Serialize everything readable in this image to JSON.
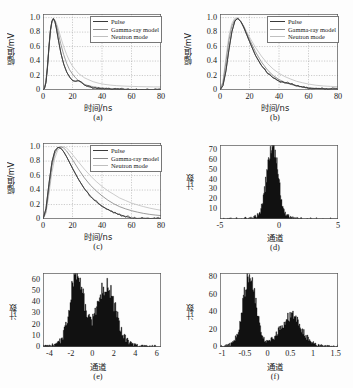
{
  "figure": {
    "panels": [
      "(a)",
      "(b)",
      "(c)",
      "(d)",
      "(e)",
      "(f)"
    ]
  },
  "labels": {
    "y_amplitude": "幅值/mV",
    "x_time": "时间/ns",
    "y_counts": "计数",
    "x_channel": "通道"
  },
  "legend": {
    "items": [
      {
        "label": "Pulse",
        "color": "#3a3a3a"
      },
      {
        "label": "Gamma-ray model",
        "color": "#8a8a8a"
      },
      {
        "label": "Neutron mode",
        "color": "#b8b8b8"
      }
    ]
  },
  "chart_data": [
    {
      "type": "line",
      "panel": "(a)",
      "title": "",
      "xlabel": "时间/ns",
      "ylabel": "幅值/mV",
      "xlim": [
        0,
        80
      ],
      "ylim": [
        0,
        1.05
      ],
      "xticks": [
        0,
        20,
        40,
        60,
        80
      ],
      "yticks": [
        0,
        0.2,
        0.4,
        0.6,
        0.8,
        1.0
      ],
      "ytick_labels": [
        "0",
        "0.2",
        "0.4",
        "0.6",
        "0.8",
        "1.0"
      ],
      "grid": true,
      "legend_position": "upper-right",
      "series": [
        {
          "name": "Pulse",
          "x": [
            0,
            1,
            2,
            3,
            4,
            5,
            6,
            7,
            8,
            9,
            10,
            12,
            14,
            16,
            18,
            20,
            22,
            24,
            26,
            28,
            30,
            34,
            38,
            42,
            46,
            50,
            55,
            60,
            65,
            70,
            75,
            80
          ],
          "values": [
            0,
            0.02,
            0.1,
            0.3,
            0.58,
            0.82,
            0.95,
            0.99,
            0.95,
            0.86,
            0.74,
            0.52,
            0.36,
            0.25,
            0.18,
            0.13,
            0.12,
            0.13,
            0.11,
            0.07,
            0.05,
            0.03,
            0.02,
            0.015,
            0.012,
            0.01,
            0.008,
            0.006,
            0.005,
            0.004,
            0.003,
            0.003
          ]
        },
        {
          "name": "Gamma-ray model",
          "x": [
            0,
            1,
            2,
            3,
            4,
            5,
            6,
            7,
            8,
            9,
            10,
            12,
            14,
            16,
            18,
            20,
            22,
            24,
            26,
            28,
            30,
            34,
            38,
            42,
            46,
            50,
            55,
            60,
            65,
            70,
            75,
            80
          ],
          "values": [
            0,
            0.03,
            0.13,
            0.34,
            0.6,
            0.82,
            0.94,
            0.98,
            0.96,
            0.9,
            0.82,
            0.64,
            0.49,
            0.37,
            0.28,
            0.22,
            0.17,
            0.13,
            0.1,
            0.08,
            0.065,
            0.045,
            0.032,
            0.024,
            0.018,
            0.014,
            0.011,
            0.009,
            0.007,
            0.006,
            0.005,
            0.004
          ]
        },
        {
          "name": "Neutron mode",
          "x": [
            0,
            1,
            2,
            3,
            4,
            5,
            6,
            7,
            8,
            9,
            10,
            12,
            14,
            16,
            18,
            20,
            22,
            24,
            26,
            28,
            30,
            34,
            38,
            42,
            46,
            50,
            55,
            60,
            65,
            70,
            75,
            80
          ],
          "values": [
            0,
            0.03,
            0.12,
            0.32,
            0.57,
            0.79,
            0.92,
            0.97,
            0.97,
            0.93,
            0.87,
            0.73,
            0.6,
            0.49,
            0.4,
            0.33,
            0.28,
            0.23,
            0.2,
            0.17,
            0.15,
            0.115,
            0.092,
            0.077,
            0.067,
            0.06,
            0.054,
            0.05,
            0.047,
            0.045,
            0.043,
            0.042
          ]
        }
      ]
    },
    {
      "type": "line",
      "panel": "(b)",
      "xlabel": "时间/ns",
      "ylabel": "幅值/mV",
      "xlim": [
        0,
        80
      ],
      "ylim": [
        0,
        1.05
      ],
      "xticks": [
        0,
        20,
        40,
        60,
        80
      ],
      "yticks": [
        0,
        0.2,
        0.4,
        0.6,
        0.8,
        1.0
      ],
      "ytick_labels": [
        "0",
        "0.2",
        "0.4",
        "0.6",
        "0.8",
        "1.0"
      ],
      "grid": true,
      "legend_position": "upper-right",
      "series": [
        {
          "name": "Pulse",
          "x": [
            0,
            2,
            4,
            6,
            8,
            10,
            12,
            14,
            16,
            18,
            20,
            24,
            28,
            32,
            36,
            40,
            44,
            48,
            52,
            56,
            60,
            65,
            70,
            75,
            80
          ],
          "values": [
            0,
            0.06,
            0.26,
            0.55,
            0.8,
            0.95,
            0.99,
            0.95,
            0.87,
            0.77,
            0.67,
            0.48,
            0.34,
            0.24,
            0.17,
            0.12,
            0.1,
            0.085,
            0.06,
            0.04,
            0.025,
            0.02,
            0.018,
            0.015,
            0.014
          ]
        },
        {
          "name": "Gamma-ray model",
          "x": [
            0,
            2,
            4,
            6,
            8,
            10,
            12,
            14,
            16,
            18,
            20,
            24,
            28,
            32,
            36,
            40,
            44,
            48,
            52,
            56,
            60,
            65,
            70,
            75,
            80
          ],
          "values": [
            0,
            0.1,
            0.38,
            0.68,
            0.88,
            0.97,
            0.99,
            0.95,
            0.88,
            0.79,
            0.7,
            0.53,
            0.39,
            0.28,
            0.2,
            0.145,
            0.105,
            0.077,
            0.056,
            0.042,
            0.031,
            0.022,
            0.017,
            0.013,
            0.011
          ]
        },
        {
          "name": "Neutron mode",
          "x": [
            0,
            2,
            4,
            6,
            8,
            10,
            12,
            14,
            16,
            18,
            20,
            24,
            28,
            32,
            36,
            40,
            44,
            48,
            52,
            56,
            60,
            65,
            70,
            75,
            80
          ],
          "values": [
            0,
            0.12,
            0.44,
            0.74,
            0.92,
            0.99,
            0.99,
            0.95,
            0.89,
            0.81,
            0.73,
            0.59,
            0.47,
            0.37,
            0.29,
            0.23,
            0.185,
            0.15,
            0.12,
            0.1,
            0.082,
            0.066,
            0.056,
            0.05,
            0.046
          ]
        }
      ]
    },
    {
      "type": "line",
      "panel": "(c)",
      "xlabel": "时间/ns",
      "ylabel": "幅值/mV",
      "xlim": [
        0,
        80
      ],
      "ylim": [
        0,
        1.05
      ],
      "xticks": [
        0,
        20,
        40,
        60,
        80
      ],
      "yticks": [
        0,
        0.2,
        0.4,
        0.6,
        0.8,
        1.0
      ],
      "ytick_labels": [
        "0",
        "0.2",
        "0.4",
        "0.6",
        "0.8",
        "1.0"
      ],
      "grid": true,
      "legend_position": "upper-right",
      "series": [
        {
          "name": "Pulse",
          "x": [
            0,
            2,
            4,
            6,
            8,
            10,
            12,
            14,
            16,
            18,
            20,
            24,
            28,
            32,
            36,
            40,
            44,
            48,
            52,
            56,
            60,
            64,
            68,
            72,
            76,
            80
          ],
          "values": [
            0,
            0.14,
            0.48,
            0.78,
            0.94,
            0.99,
            0.98,
            0.93,
            0.86,
            0.78,
            0.7,
            0.55,
            0.42,
            0.32,
            0.24,
            0.18,
            0.13,
            0.09,
            0.06,
            0.035,
            0.015,
            0.008,
            0.012,
            0.006,
            0.01,
            0.005
          ]
        },
        {
          "name": "Gamma-ray model",
          "x": [
            0,
            2,
            4,
            6,
            8,
            10,
            12,
            14,
            16,
            18,
            20,
            24,
            28,
            32,
            36,
            40,
            44,
            48,
            52,
            56,
            60,
            64,
            68,
            72,
            76,
            80
          ],
          "values": [
            0,
            0.1,
            0.4,
            0.72,
            0.9,
            0.98,
            1.0,
            0.98,
            0.94,
            0.88,
            0.82,
            0.69,
            0.57,
            0.47,
            0.39,
            0.32,
            0.26,
            0.21,
            0.17,
            0.14,
            0.115,
            0.095,
            0.078,
            0.065,
            0.055,
            0.047
          ]
        },
        {
          "name": "Neutron mode",
          "x": [
            0,
            2,
            4,
            6,
            8,
            10,
            12,
            14,
            16,
            18,
            20,
            24,
            28,
            32,
            36,
            40,
            44,
            48,
            52,
            56,
            60,
            64,
            68,
            72,
            76,
            80
          ],
          "values": [
            0,
            0.08,
            0.34,
            0.64,
            0.84,
            0.95,
            0.99,
            1.0,
            0.98,
            0.94,
            0.89,
            0.79,
            0.69,
            0.6,
            0.52,
            0.45,
            0.39,
            0.34,
            0.29,
            0.255,
            0.22,
            0.195,
            0.172,
            0.152,
            0.135,
            0.12
          ]
        }
      ]
    },
    {
      "type": "bar",
      "panel": "(d)",
      "xlabel": "通道",
      "ylabel": "计数",
      "xlim": [
        -5,
        5
      ],
      "ylim": [
        0,
        75
      ],
      "xticks": [
        -5,
        0,
        5
      ],
      "yticks": [
        10,
        20,
        30,
        40,
        50,
        60,
        70
      ],
      "grid": false,
      "distribution": "unimodal",
      "peaks": [
        {
          "center": -0.55,
          "height": 72,
          "width": 0.45
        }
      ],
      "bin_width": 0.05,
      "baseline_noise": 1.5,
      "fill_color": "#111111"
    },
    {
      "type": "bar",
      "panel": "(e)",
      "xlabel": "通道",
      "ylabel": "计数",
      "xlim": [
        -4.6,
        6.4
      ],
      "ylim": [
        0,
        66
      ],
      "xticks": [
        -4,
        -2,
        0,
        2,
        4,
        6
      ],
      "yticks": [
        0,
        10,
        20,
        30,
        40,
        50,
        60
      ],
      "grid": false,
      "distribution": "bimodal",
      "peaks": [
        {
          "center": -1.45,
          "height": 60,
          "width": 0.62
        },
        {
          "center": 1.3,
          "height": 50,
          "width": 0.85
        }
      ],
      "bin_width": 0.07,
      "baseline_noise": 2.0,
      "fill_color": "#111111"
    },
    {
      "type": "bar",
      "panel": "(f)",
      "xlabel": "通道",
      "ylabel": "计数",
      "xlim": [
        -1.05,
        1.55
      ],
      "ylim": [
        0,
        85
      ],
      "xticks": [
        -1,
        -0.5,
        0,
        0.5,
        1,
        1.5
      ],
      "xtick_labels": [
        "-1",
        "-0.5",
        "0",
        "0.5",
        "1",
        "1.5"
      ],
      "yticks": [
        0,
        20,
        40,
        60,
        80
      ],
      "grid": false,
      "distribution": "bimodal",
      "peaks": [
        {
          "center": -0.4,
          "height": 78,
          "width": 0.135
        },
        {
          "center": 0.52,
          "height": 33,
          "width": 0.225
        }
      ],
      "bin_width": 0.016,
      "baseline_noise": 2.5,
      "fill_color": "#111111"
    }
  ]
}
